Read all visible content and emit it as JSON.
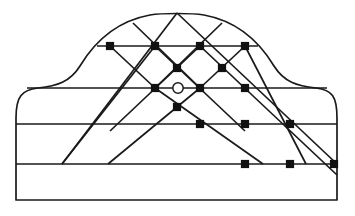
{
  "figure": {
    "canvas": {
      "width": 355,
      "height": 216
    },
    "colors": {
      "background": "#ffffff",
      "stroke": "#1a1a1a",
      "node_fill": "#111111",
      "ring_fill": "#ffffff"
    }
  },
  "chart_data": {
    "type": "diagram",
    "xlabel": "",
    "ylabel": "",
    "xlim": [
      0,
      355
    ],
    "ylim": [
      0,
      216
    ],
    "grid": false,
    "legend": "none",
    "outline": {
      "name": "ogee-dome-outline",
      "left_edge_x": 16,
      "right_edge_x": 337,
      "base_y": 200,
      "apex_y": 13,
      "apex_x": 177,
      "shoulder_y": 88,
      "path": "M 16 200 L 16 118 C 16 96 22 90 38 88 C 57 86 70 82 80 66 C 92 46 112 22 150 15 C 162 13 192 13 204 15 C 242 22 262 46 274 66 C 284 82 297 86 316 88 C 332 90 337 96 337 118 L 337 200 Z"
    },
    "courses": [
      {
        "name": "course-1",
        "y": 46,
        "x1": 97,
        "x2": 258
      },
      {
        "name": "course-2",
        "y": 88,
        "x1": 27,
        "x2": 327
      },
      {
        "name": "course-3",
        "y": 124,
        "x1": 16,
        "x2": 337
      },
      {
        "name": "course-4",
        "y": 164,
        "x1": 16,
        "x2": 337
      },
      {
        "name": "course-5-base",
        "y": 200,
        "x1": 16,
        "x2": 337
      }
    ],
    "diagonals_down_right": [
      {
        "name": "down-right-1",
        "x1": 110,
        "y1": 46,
        "x2": 155,
        "y2": 88
      },
      {
        "name": "down-right-2",
        "x1": 133,
        "y1": 23,
        "x2": 200,
        "y2": 88
      },
      {
        "name": "down-right-3",
        "x1": 155,
        "y1": 46,
        "x2": 245,
        "y2": 131
      },
      {
        "name": "down-right-4",
        "x1": 177,
        "y1": 13,
        "x2": 337,
        "y2": 164
      },
      {
        "name": "down-right-5",
        "x1": 200,
        "y1": 46,
        "x2": 337,
        "y2": 175
      },
      {
        "name": "down-right-6",
        "x1": 245,
        "y1": 46,
        "x2": 306,
        "y2": 164
      },
      {
        "name": "down-right-7",
        "x1": 155,
        "y1": 88,
        "x2": 263,
        "y2": 164
      }
    ],
    "diagonals_down_left": [
      {
        "name": "down-left-1",
        "x1": 245,
        "y1": 46,
        "x2": 200,
        "y2": 88
      },
      {
        "name": "down-left-2",
        "x1": 222,
        "y1": 23,
        "x2": 155,
        "y2": 88
      },
      {
        "name": "down-left-3",
        "x1": 200,
        "y1": 46,
        "x2": 110,
        "y2": 131
      },
      {
        "name": "down-left-4",
        "x1": 177,
        "y1": 13,
        "x2": 62,
        "y2": 164
      },
      {
        "name": "down-left-5",
        "x1": 155,
        "y1": 46,
        "x2": 62,
        "y2": 164
      },
      {
        "name": "down-left-6",
        "x1": 200,
        "y1": 88,
        "x2": 108,
        "y2": 164
      }
    ],
    "nodes": [
      {
        "name": "node-c1-a",
        "x": 110,
        "y": 46
      },
      {
        "name": "node-c1-b",
        "x": 155,
        "y": 46
      },
      {
        "name": "node-c1-c",
        "x": 200,
        "y": 46
      },
      {
        "name": "node-c1-d",
        "x": 245,
        "y": 46
      },
      {
        "name": "node-mid-upper-left",
        "x": 177,
        "y": 68
      },
      {
        "name": "node-mid-upper-right",
        "x": 222,
        "y": 68
      },
      {
        "name": "node-c2-a",
        "x": 155,
        "y": 88
      },
      {
        "name": "node-c2-b",
        "x": 200,
        "y": 88
      },
      {
        "name": "node-c2-c",
        "x": 245,
        "y": 88
      },
      {
        "name": "node-mid-lower",
        "x": 177,
        "y": 107
      },
      {
        "name": "node-c3-a",
        "x": 200,
        "y": 124
      },
      {
        "name": "node-c3-b",
        "x": 245,
        "y": 124
      },
      {
        "name": "node-c3-c",
        "x": 290,
        "y": 124
      },
      {
        "name": "node-c4-a",
        "x": 245,
        "y": 164
      },
      {
        "name": "node-c4-b",
        "x": 290,
        "y": 164
      },
      {
        "name": "node-c4-c",
        "x": 334,
        "y": 164
      }
    ],
    "ring": {
      "name": "centre-ring",
      "cx": 178,
      "cy": 88,
      "r": 5.2
    }
  }
}
